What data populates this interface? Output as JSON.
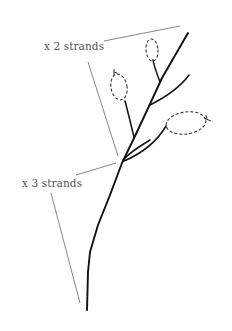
{
  "diagram": {
    "type": "botanical-sketch",
    "labels": [
      {
        "id": "upper",
        "text": "x 2 strands"
      },
      {
        "id": "lower",
        "text": "x 3 strands"
      }
    ],
    "colors": {
      "stem": "#111111",
      "leaf_outline": "#333333",
      "leader_line": "#666666",
      "label_text": "#555555",
      "background": "#ffffff"
    }
  }
}
